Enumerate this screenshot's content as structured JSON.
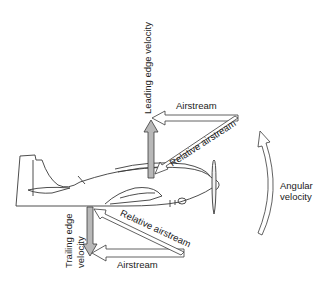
{
  "diagram": {
    "labels": {
      "leading_edge_velocity": "Leading edge velocity",
      "top_airstream": "Airstream",
      "top_relative_airstream": "Relative airstream",
      "trailing_edge_velocity_line1": "Trailing edge",
      "trailing_edge_velocity_line2": "velocity",
      "bottom_relative_airstream": "Relative airstream",
      "bottom_airstream": "Airstream",
      "angular_velocity_line1": "Angular",
      "angular_velocity_line2": "velocity"
    },
    "colors": {
      "line": "#3a3a3a",
      "velocity_arrow_fill": "#b8b8b8",
      "background": "#ffffff"
    }
  }
}
